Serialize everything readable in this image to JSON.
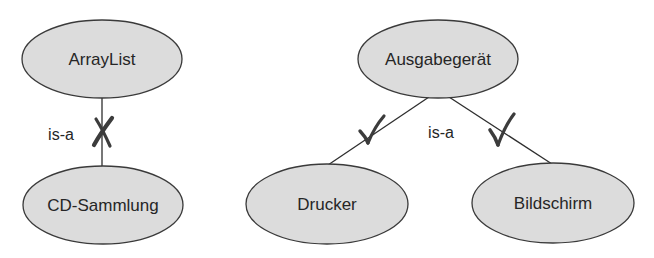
{
  "diagrams": {
    "left": {
      "parent": {
        "label": "ArrayList"
      },
      "child": {
        "label": "CD-Sammlung"
      },
      "relation": {
        "label": "is-a",
        "valid": false,
        "mark": "cross-mark"
      }
    },
    "right": {
      "parent": {
        "label": "Ausgabegerät"
      },
      "children": [
        {
          "label": "Drucker",
          "valid": true,
          "mark": "check-mark"
        },
        {
          "label": "Bildschirm",
          "valid": true,
          "mark": "check-mark"
        }
      ],
      "relation": {
        "label": "is-a"
      }
    }
  },
  "colors": {
    "node_fill": "#dcdcdc",
    "node_stroke": "#3a3a3a",
    "text": "#262626",
    "mark": "#3c3c3c"
  }
}
